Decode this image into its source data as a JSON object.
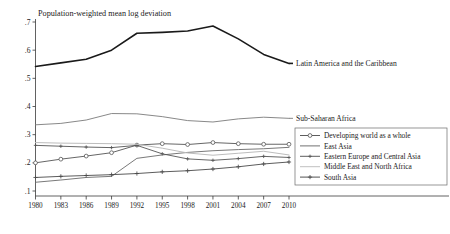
{
  "chart_data": {
    "type": "line",
    "title": "Population-weighted mean log deviation",
    "xlabel": "",
    "ylabel": "",
    "xlim": [
      1980,
      2010
    ],
    "ylim": [
      0.1,
      0.7
    ],
    "grid": false,
    "legend_position": "bottom-right",
    "x_ticks": [
      "1980",
      "1983",
      "1986",
      "1989",
      "1992",
      "1995",
      "1998",
      "2001",
      "2004",
      "2007",
      "2010"
    ],
    "y_ticks": [
      ".1",
      ".2",
      ".3",
      ".4",
      ".5",
      ".6",
      ".7"
    ],
    "x": [
      1980,
      1983,
      1986,
      1989,
      1992,
      1995,
      1998,
      2001,
      2004,
      2007,
      2010
    ],
    "series": [
      {
        "name": "Latin America and the Caribbean",
        "annotation": "Latin America and the Caribbean",
        "color": "#1a1a1a",
        "width": 1.6,
        "marker": "none",
        "values": [
          0.542,
          0.555,
          0.568,
          0.6,
          0.66,
          0.663,
          0.668,
          0.686,
          0.64,
          0.585,
          0.553
        ]
      },
      {
        "name": "Sub-Saharan Africa",
        "annotation": "Sub-Saharan Africa",
        "color": "#7a7a7a",
        "width": 0.9,
        "marker": "none",
        "values": [
          0.335,
          0.34,
          0.352,
          0.375,
          0.374,
          0.364,
          0.35,
          0.345,
          0.356,
          0.362,
          0.358
        ]
      },
      {
        "name": "Developing world as a whole",
        "annotation": "",
        "color": "#555555",
        "width": 0.9,
        "marker": "circle",
        "values": [
          0.2,
          0.213,
          0.224,
          0.236,
          0.263,
          0.268,
          0.265,
          0.272,
          0.268,
          0.266,
          0.266
        ]
      },
      {
        "name": "East Asia",
        "annotation": "",
        "color": "#6a6a6a",
        "width": 0.9,
        "marker": "none",
        "values": [
          0.131,
          0.139,
          0.148,
          0.152,
          0.216,
          0.228,
          0.237,
          0.243,
          0.247,
          0.25,
          0.255
        ]
      },
      {
        "name": "Eastern Europe and Central Asia",
        "annotation": "",
        "color": "#555555",
        "width": 0.9,
        "marker": "plus-small",
        "values": [
          0.262,
          0.259,
          0.256,
          0.254,
          0.262,
          0.232,
          0.214,
          0.209,
          0.215,
          0.223,
          0.219
        ]
      },
      {
        "name": "Middle East and North Africa",
        "annotation": "",
        "color": "#bdbdbd",
        "width": 1.0,
        "marker": "none",
        "values": [
          0.272,
          0.27,
          0.269,
          0.268,
          0.266,
          0.252,
          0.235,
          0.227,
          0.234,
          0.241,
          0.228
        ]
      },
      {
        "name": "South Asia",
        "annotation": "",
        "color": "#4a4a4a",
        "width": 0.9,
        "marker": "plus",
        "values": [
          0.148,
          0.152,
          0.155,
          0.158,
          0.162,
          0.168,
          0.172,
          0.178,
          0.186,
          0.196,
          0.203
        ]
      }
    ],
    "legend_entries": [
      {
        "label": "Developing world as a whole",
        "marker": "circle",
        "color": "#555555"
      },
      {
        "label": "East Asia",
        "marker": "none",
        "color": "#6a6a6a"
      },
      {
        "label": "Eastern Europe and Central Asia",
        "marker": "plus-small",
        "color": "#555555"
      },
      {
        "label": "Middle East and North Africa",
        "marker": "none",
        "color": "#bdbdbd"
      },
      {
        "label": "South Asia",
        "marker": "plus",
        "color": "#4a4a4a"
      }
    ]
  }
}
